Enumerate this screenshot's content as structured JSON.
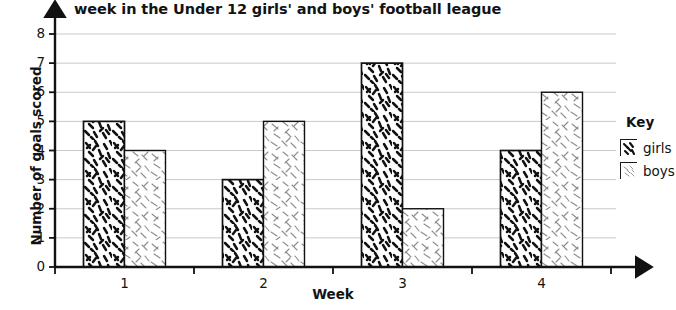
{
  "chart_data": {
    "type": "bar",
    "title": "week in the Under 12 girls' and boys' football league",
    "xlabel": "Week",
    "ylabel": "Number of goals scored",
    "categories": [
      "1",
      "2",
      "3",
      "4"
    ],
    "series": [
      {
        "name": "girls",
        "values": [
          5,
          3,
          7,
          4
        ],
        "pattern": "dense-dark-dashes",
        "color": "#1a1a1a"
      },
      {
        "name": "boys",
        "values": [
          4,
          5,
          2,
          6
        ],
        "pattern": "sparse-light-dashes",
        "color": "#9a9a9a"
      }
    ],
    "ylim": [
      0,
      8
    ],
    "ytick_labels": [
      "0",
      "1",
      "2",
      "3",
      "4",
      "5",
      "6",
      "7",
      "8"
    ],
    "grid": true,
    "legend_position": "right",
    "legend_title": "Key"
  },
  "legend": {
    "title": "Key",
    "items": [
      {
        "label": "girls"
      },
      {
        "label": "boys"
      }
    ]
  }
}
